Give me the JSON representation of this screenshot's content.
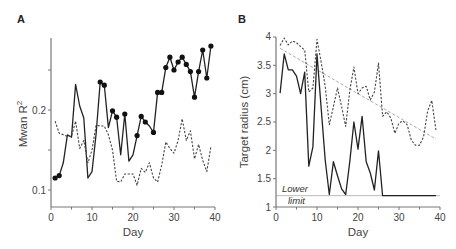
{
  "chart_data": [
    {
      "panel": "A",
      "type": "line",
      "title": "",
      "xlabel": "Day",
      "ylabel": "Mwan R²",
      "ylabel_base": "Mwan R",
      "ylabel_sup": "2",
      "xlim": [
        0,
        40
      ],
      "ylim": [
        0.079,
        0.29
      ],
      "xticks": [
        0,
        10,
        20,
        30,
        40
      ],
      "xtick_minor": [
        5,
        15,
        25,
        35
      ],
      "yticks_labeled": [
        0.1,
        0.2
      ],
      "yticks_all": [
        0.1,
        0.15,
        0.2,
        0.25
      ],
      "ytick_labels": [
        "0.1",
        "0.2"
      ],
      "xtick_labels": [
        "0",
        "10",
        "20",
        "30",
        "40"
      ],
      "grid": false,
      "legend": null,
      "series": [
        {
          "name": "solid",
          "style": "solid",
          "color": "#222222",
          "x": [
            1,
            2,
            3,
            4,
            5,
            6,
            7,
            8,
            9,
            10,
            11,
            12,
            13,
            14,
            15,
            16,
            17,
            18,
            19,
            20,
            21,
            22,
            23,
            24,
            25,
            26,
            27,
            28,
            29,
            30,
            31,
            32,
            33,
            34,
            35,
            36,
            37,
            38,
            39
          ],
          "values": [
            0.115,
            0.118,
            0.134,
            0.169,
            0.166,
            0.232,
            0.205,
            0.19,
            0.115,
            0.123,
            0.17,
            0.235,
            0.231,
            0.178,
            0.199,
            0.191,
            0.144,
            0.195,
            0.136,
            0.144,
            0.168,
            0.192,
            0.185,
            0.18,
            0.172,
            0.222,
            0.222,
            0.253,
            0.266,
            0.25,
            0.26,
            0.266,
            0.257,
            0.248,
            0.216,
            0.248,
            0.275,
            0.24,
            0.28
          ],
          "markers_at": [
            1,
            2,
            12,
            13,
            15,
            16,
            18,
            21,
            22,
            23,
            25,
            26,
            27,
            28,
            29,
            30,
            31,
            32,
            33,
            34,
            35,
            36,
            37,
            38,
            39
          ]
        },
        {
          "name": "dashed",
          "style": "dashed",
          "color": "#444444",
          "x": [
            1,
            2,
            3,
            4,
            5,
            6,
            7,
            8,
            9,
            10,
            11,
            12,
            13,
            14,
            15,
            16,
            17,
            18,
            19,
            20,
            21,
            22,
            23,
            24,
            25,
            26,
            27,
            28,
            29,
            30,
            31,
            32,
            33,
            34,
            35,
            36,
            37,
            38,
            39
          ],
          "values": [
            0.186,
            0.171,
            0.169,
            0.167,
            0.167,
            0.186,
            0.152,
            0.162,
            0.134,
            0.15,
            0.181,
            0.18,
            0.18,
            0.169,
            0.15,
            0.111,
            0.11,
            0.12,
            0.12,
            0.12,
            0.106,
            0.127,
            0.122,
            0.134,
            0.115,
            0.11,
            0.131,
            0.16,
            0.152,
            0.146,
            0.162,
            0.189,
            0.162,
            0.174,
            0.139,
            0.157,
            0.137,
            0.123,
            0.154
          ]
        }
      ]
    },
    {
      "panel": "B",
      "type": "line",
      "title": "",
      "xlabel": "Day",
      "ylabel": "Target radius (cm)",
      "xlim": [
        0,
        40
      ],
      "ylim": [
        1,
        4
      ],
      "xticks": [
        0,
        10,
        20,
        30,
        40
      ],
      "xtick_minor": [
        5,
        15,
        25,
        35
      ],
      "yticks_all": [
        1,
        1.5,
        2,
        2.5,
        3,
        3.5,
        4
      ],
      "ytick_labels": [
        "1",
        "1.5",
        "2",
        "2.5",
        "3",
        "3.5",
        "4"
      ],
      "xtick_labels": [
        "0",
        "10",
        "20",
        "30",
        "40"
      ],
      "grid": false,
      "legend": null,
      "annotations": [
        {
          "text_line1": "Lower",
          "text_line2": "limit",
          "y": 1.2
        }
      ],
      "reference_line": {
        "name": "Lower limit",
        "y": 1.2,
        "color": "#bbbbbb"
      },
      "trend_line": {
        "x": [
          1,
          39
        ],
        "values": [
          3.8,
          2.2
        ],
        "style": "dashed",
        "color": "#aaaaaa"
      },
      "series": [
        {
          "name": "solid",
          "style": "solid",
          "color": "#222222",
          "x": [
            1,
            2,
            3,
            4,
            5,
            6,
            7,
            8,
            9,
            10,
            11,
            12,
            13,
            14,
            15,
            16,
            17,
            18,
            19,
            20,
            21,
            22,
            23,
            24,
            25,
            26,
            27,
            28,
            29,
            30,
            31,
            32,
            33,
            34,
            35,
            36,
            37,
            38,
            39
          ],
          "values": [
            3.01,
            3.7,
            3.42,
            3.42,
            3.31,
            3.0,
            3.38,
            1.72,
            2.06,
            3.7,
            2.76,
            1.83,
            1.22,
            1.8,
            1.55,
            1.32,
            1.22,
            1.8,
            2.5,
            2.02,
            2.6,
            1.8,
            1.6,
            1.3,
            1.99,
            1.2,
            1.2,
            1.2,
            1.2,
            1.2,
            1.2,
            1.2,
            1.2,
            1.2,
            1.2,
            1.2,
            1.2,
            1.2,
            1.2
          ]
        },
        {
          "name": "dashed",
          "style": "dashed",
          "color": "#444444",
          "x": [
            1,
            2,
            3,
            4,
            5,
            6,
            7,
            8,
            9,
            10,
            11,
            12,
            13,
            14,
            15,
            16,
            17,
            18,
            19,
            20,
            21,
            22,
            23,
            24,
            25,
            26,
            27,
            28,
            29,
            30,
            31,
            32,
            33,
            34,
            35,
            36,
            37,
            38,
            39
          ],
          "values": [
            3.85,
            3.98,
            3.86,
            3.93,
            3.9,
            3.83,
            3.77,
            3.03,
            3.1,
            3.96,
            3.56,
            3.13,
            2.45,
            2.77,
            3.1,
            2.77,
            2.42,
            3.06,
            3.47,
            3.0,
            3.1,
            3.13,
            2.89,
            3.03,
            3.54,
            2.6,
            2.68,
            2.57,
            2.3,
            2.48,
            2.52,
            2.45,
            2.18,
            2.09,
            2.09,
            2.24,
            2.7,
            2.88,
            2.36
          ]
        }
      ]
    }
  ],
  "labels": {
    "panelA": "A",
    "panelB": "B",
    "a_xlabel": "Day",
    "a_ylabel_base": "Mwan R",
    "a_ylabel_sup": "2",
    "b_xlabel": "Day",
    "b_ylabel": "Target radius (cm)",
    "lower": "Lower",
    "limit": "limit"
  }
}
